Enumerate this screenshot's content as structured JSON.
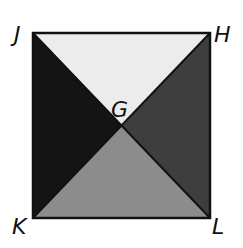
{
  "figure": {
    "type": "square divided by diagonals",
    "vertices": {
      "J": {
        "label": "J",
        "x": 33,
        "y": 33
      },
      "H": {
        "label": "H",
        "x": 210,
        "y": 33
      },
      "K": {
        "label": "K",
        "x": 33,
        "y": 218
      },
      "L": {
        "label": "L",
        "x": 210,
        "y": 218
      }
    },
    "center": {
      "label": "G",
      "x": 122,
      "y": 126
    },
    "regions": {
      "top": {
        "name": "triangle JGH",
        "color": "#ececec"
      },
      "left": {
        "name": "triangle JGK",
        "color": "#141414"
      },
      "right": {
        "name": "triangle HGL",
        "color": "#3e3e3e"
      },
      "bottom": {
        "name": "triangle KGL",
        "color": "#8c8c8c"
      }
    },
    "stroke_color": "#111111"
  }
}
